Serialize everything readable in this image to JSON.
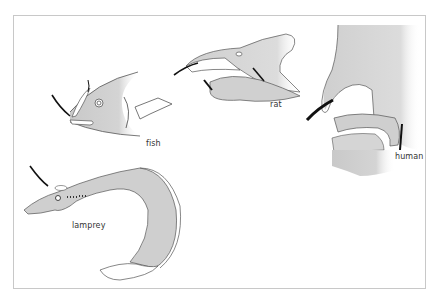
{
  "figure": {
    "labels": {
      "fish": "fish",
      "rat": "rat",
      "human": "human",
      "lamprey": "lamprey"
    },
    "colors": {
      "fill": "#cfcfcf",
      "outline": "#555555",
      "arrow": "#111111",
      "frame": "#c8c8c8"
    }
  }
}
